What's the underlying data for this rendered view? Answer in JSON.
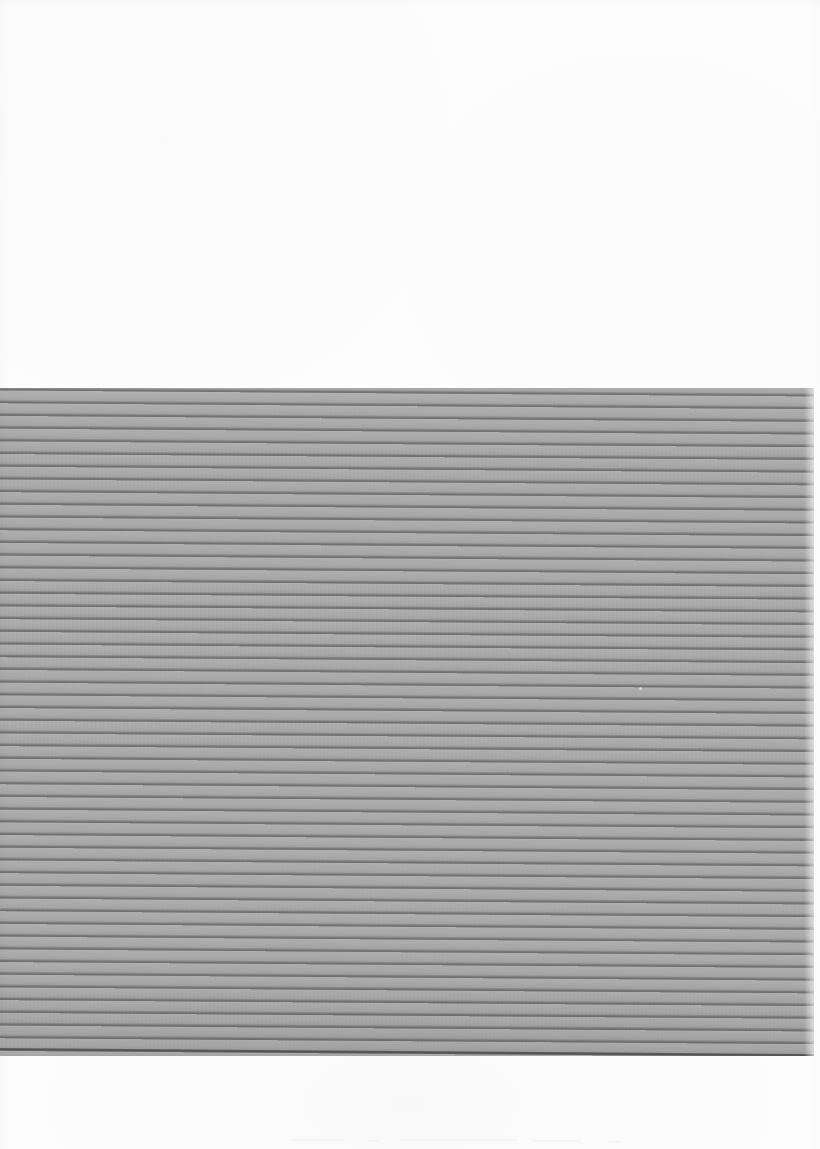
{
  "document": {
    "kind": "scanned-page",
    "title": "Scanned ruled sheet",
    "description": "A scanned page: blank white upper margin, a large mid-grey horizontally ruled band, and a blank white lower margin. No legible text is present.",
    "page_width": 820,
    "page_height": 1149,
    "orientation": "portrait",
    "has_legible_text": "no",
    "background_color": "#fdfdfd"
  },
  "regions": {
    "top_margin": {
      "name": "Upper blank margin",
      "top": 0,
      "height": 392,
      "color": "#fdfdfd",
      "content": ""
    },
    "ruled_band": {
      "name": "Grey ruled band",
      "top": 392,
      "bottom": 1054,
      "left": 0,
      "right": 812,
      "fill_color": "#a9a9a9",
      "rule_color": "#5a5a5a",
      "rule_spacing_px": 12.7,
      "rule_count": 52,
      "skew_degrees": 0.42,
      "content": ""
    },
    "bottom_margin": {
      "name": "Lower blank margin",
      "top": 1055,
      "height": 94,
      "color": "#fdfdfd",
      "content": ""
    }
  },
  "artifacts": {
    "dust_speck": {
      "name": "light scan speck",
      "x": 639,
      "y": 687
    },
    "bottom_streaks": [
      {
        "x": 292,
        "y": 1139,
        "width": 52
      },
      {
        "x": 368,
        "y": 1140,
        "width": 14
      },
      {
        "x": 400,
        "y": 1139,
        "width": 118
      },
      {
        "x": 532,
        "y": 1140,
        "width": 50
      },
      {
        "x": 608,
        "y": 1141,
        "width": 12
      }
    ]
  }
}
